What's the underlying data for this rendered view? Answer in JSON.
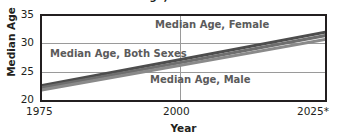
{
  "chart_data": {
    "type": "line",
    "title": "Median Age, 1975 to 2025",
    "xlabel": "Year",
    "ylabel": "Median Age",
    "xlim": [
      1975,
      2025
    ],
    "ylim": [
      20,
      35
    ],
    "yticks": [
      "20",
      "25",
      "30",
      "35"
    ],
    "xticks": [
      "1975",
      "2000",
      "2025*"
    ],
    "grid": true,
    "legend_position": "inline-annotations",
    "x": [
      1975,
      2000,
      2025
    ],
    "series": [
      {
        "name": "Median Age, Female",
        "values": [
          22.6,
          27.3,
          32.1
        ],
        "color": "#4d4d4d"
      },
      {
        "name": "Median Age, Both Sexes",
        "values": [
          22.2,
          26.8,
          31.5
        ],
        "color": "#6e6e6e"
      },
      {
        "name": "Median Age, Male",
        "values": [
          21.8,
          26.3,
          30.8
        ],
        "color": "#8a8a8a"
      }
    ],
    "annotations": [
      {
        "text": "Median Age, Female",
        "x": 2008,
        "y": 33.6
      },
      {
        "text": "Median Age, Both Sexes",
        "x": 1980,
        "y": 28.5
      },
      {
        "text": "Median Age, Male",
        "x": 2004,
        "y": 24.0
      }
    ]
  },
  "axes": {
    "ylabel": "Median Age",
    "xlabel": "Year",
    "yticks": {
      "t35": "35",
      "t30": "30",
      "t25": "25",
      "t20": "20"
    },
    "xticks": {
      "t1975": "1975",
      "t2000": "2000",
      "t2025": "2025*"
    }
  },
  "labels": {
    "female": "Median Age, Female",
    "both_sexes": "Median Age, Both Sexes",
    "male": "Median Age, Male"
  },
  "colors": {
    "axis": "#231f20",
    "grid": "#9a9a9a",
    "label_text": "#5b5b5b",
    "series_female": "#4d4d4d",
    "series_both": "#6e6e6e",
    "series_male": "#8a8a8a"
  },
  "title": "Median Age, 1975 to 2025"
}
